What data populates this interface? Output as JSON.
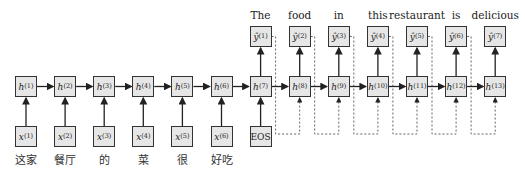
{
  "diagram": {
    "type": "seq2seq-rnn",
    "encoder": {
      "inputs": [
        {
          "label": "x",
          "index": "(1)",
          "word": "这家"
        },
        {
          "label": "x",
          "index": "(2)",
          "word": "餐厅"
        },
        {
          "label": "x",
          "index": "(3)",
          "word": "的"
        },
        {
          "label": "x",
          "index": "(4)",
          "word": "菜"
        },
        {
          "label": "x",
          "index": "(5)",
          "word": "很"
        },
        {
          "label": "x",
          "index": "(6)",
          "word": "好吃"
        }
      ],
      "hidden": [
        {
          "label": "h",
          "index": "(1)"
        },
        {
          "label": "h",
          "index": "(2)"
        },
        {
          "label": "h",
          "index": "(3)"
        },
        {
          "label": "h",
          "index": "(4)"
        },
        {
          "label": "h",
          "index": "(5)"
        },
        {
          "label": "h",
          "index": "(6)"
        }
      ]
    },
    "decoder": {
      "start_token": "EOS",
      "hidden": [
        {
          "label": "h",
          "index": "(7)"
        },
        {
          "label": "h",
          "index": "(8)"
        },
        {
          "label": "h",
          "index": "(9)"
        },
        {
          "label": "h",
          "index": "(10)"
        },
        {
          "label": "h",
          "index": "(11)"
        },
        {
          "label": "h",
          "index": "(12)"
        },
        {
          "label": "h",
          "index": "(13)"
        }
      ],
      "outputs": [
        {
          "label": "ŷ",
          "index": "(1)",
          "word": "The"
        },
        {
          "label": "ŷ",
          "index": "(2)",
          "word": "food"
        },
        {
          "label": "ŷ",
          "index": "(3)",
          "word": "in"
        },
        {
          "label": "ŷ",
          "index": "(4)",
          "word": "this"
        },
        {
          "label": "ŷ",
          "index": "(5)",
          "word": "restaurant"
        },
        {
          "label": "ŷ",
          "index": "(6)",
          "word": "is"
        },
        {
          "label": "ŷ",
          "index": "(7)",
          "word": "delicious"
        }
      ]
    }
  }
}
